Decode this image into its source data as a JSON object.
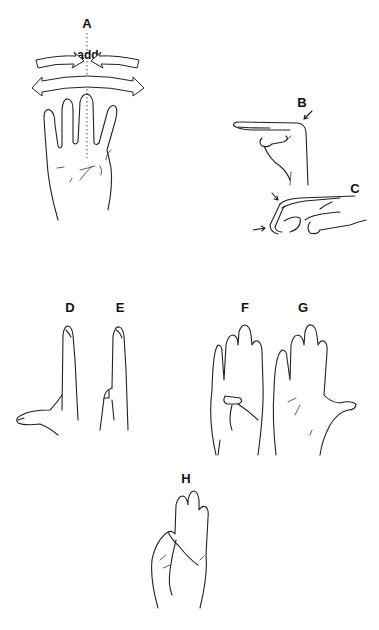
{
  "figure": {
    "panels": [
      {
        "id": "A",
        "label": "A",
        "description": "Palm view of hand showing abduction and adduction of fingers relative to middle-finger axis"
      },
      {
        "id": "B",
        "label": "B",
        "description": "Side view, fingers flexed at MCP joints with straight IP joints"
      },
      {
        "id": "C",
        "label": "C",
        "description": "Side view, fingers extended at MCP with flexed IP joints"
      },
      {
        "id": "D",
        "label": "D",
        "description": "Side view, thumb abducted"
      },
      {
        "id": "E",
        "label": "E",
        "description": "Side view, thumb adducted"
      },
      {
        "id": "F",
        "label": "F",
        "description": "Palm view, thumb opposed across palm"
      },
      {
        "id": "G",
        "label": "G",
        "description": "Palm view, thumb extended"
      },
      {
        "id": "H",
        "label": "H",
        "description": "Thumb opposed to little finger tip"
      }
    ],
    "annotations": {
      "adduction": "add",
      "abduction": "abd"
    },
    "colors": {
      "ink": "#222222",
      "background": "#ffffff"
    }
  }
}
